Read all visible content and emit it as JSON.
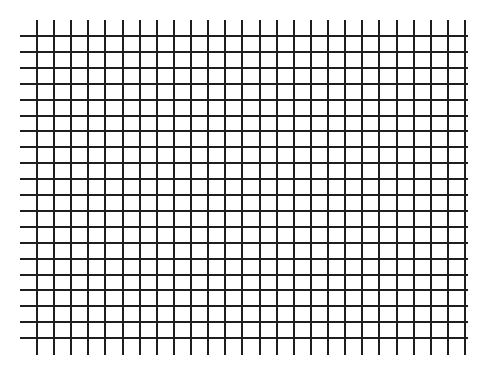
{
  "grid": {
    "line_color": "#1e1e1e",
    "background": "#ffffff",
    "vertical": {
      "count": 26,
      "first_x": 36,
      "spacing": 17.12,
      "top": 20,
      "bottom": 355
    },
    "horizontal": {
      "count": 20,
      "first_y": 35,
      "spacing": 15.9,
      "left": 20,
      "right": 468
    }
  }
}
